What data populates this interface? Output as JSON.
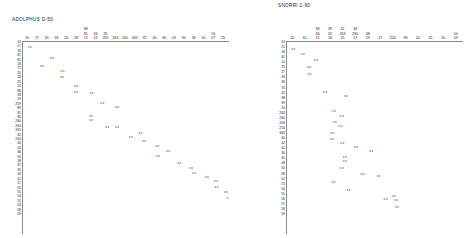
{
  "panels": [
    {
      "id": "left",
      "title": "ADOLPHUS D-50",
      "x_ticks": [
        [
          "10"
        ],
        [
          "71"
        ],
        [
          "16"
        ],
        [
          "18"
        ],
        [
          "20"
        ],
        [
          "28"
        ],
        [
          "15",
          "81",
          "88"
        ],
        [
          "24",
          "33"
        ],
        [
          "259",
          "25"
        ],
        [
          "263"
        ],
        [
          "261"
        ],
        [
          "260"
        ],
        [
          "32"
        ],
        [
          "40"
        ],
        [
          "30"
        ],
        [
          "29"
        ],
        [
          "90"
        ],
        [
          "36"
        ],
        [
          "50"
        ],
        [
          "57",
          "56"
        ],
        [
          "55"
        ]
      ],
      "y_ticks": [
        "10",
        "17",
        "16",
        "87",
        "81",
        "18",
        "71",
        "20",
        "28",
        "25",
        "24",
        "88",
        "33",
        "29",
        "259",
        "89",
        "81",
        "30",
        "260",
        "263",
        "261",
        "32",
        "264",
        "40",
        "50",
        "36",
        "90",
        "38",
        "37",
        "35",
        "34",
        "41",
        "57",
        "56",
        "55",
        "54",
        "52",
        "53",
        "58",
        "59"
      ]
    },
    {
      "id": "right",
      "title": "SNORRI 2-90",
      "x_ticks": [
        [
          "10"
        ],
        [
          "61"
        ],
        [
          "21",
          "34",
          "38"
        ],
        [
          "18",
          "32",
          "39"
        ],
        [
          "25",
          "263",
          "41"
        ],
        [
          "57",
          "260",
          "36"
        ],
        [
          "29",
          "48"
        ],
        [
          "27"
        ],
        [
          "254"
        ],
        [
          "98"
        ],
        [
          "42"
        ],
        [
          "45"
        ],
        [
          "50"
        ],
        [
          "59",
          "54"
        ]
      ],
      "y_ticks": [
        "10",
        "21",
        "18",
        "61",
        "10",
        "25",
        "27",
        "34",
        "36",
        "70",
        "32",
        "38",
        "39",
        "20",
        "263",
        "260",
        "264",
        "254",
        "363",
        "40",
        "42",
        "41",
        "30",
        "45",
        "48",
        "50",
        "98",
        "52",
        "53",
        "54",
        "55",
        "56",
        "57",
        "58",
        "59"
      ]
    }
  ],
  "chart_data": [
    {
      "type": "scatter",
      "title": "ADOLPHUS D-50",
      "xlabel": "",
      "ylabel": "",
      "marker": "xx",
      "grid": false,
      "legend": "none",
      "xlim": [
        0,
        21
      ],
      "ylim": [
        0,
        40
      ],
      "note": "Near-monotonic descending diagonal of paired 'xx' markers; row index increases downward as column index increases rightward.",
      "points": [
        {
          "x": 0.3,
          "y": 0.5
        },
        {
          "x": 2.6,
          "y": 3.0
        },
        {
          "x": 1.55,
          "y": 5.0
        },
        {
          "x": 3.65,
          "y": 6.0
        },
        {
          "x": 3.6,
          "y": 7.6
        },
        {
          "x": 5.05,
          "y": 9.6
        },
        {
          "x": 5.0,
          "y": 11.0
        },
        {
          "x": 6.6,
          "y": 11.4
        },
        {
          "x": 7.7,
          "y": 13.6
        },
        {
          "x": 9.2,
          "y": 14.6
        },
        {
          "x": 6.55,
          "y": 16.6
        },
        {
          "x": 6.55,
          "y": 17.6
        },
        {
          "x": 8.2,
          "y": 19.4
        },
        {
          "x": 9.2,
          "y": 19.2
        },
        {
          "x": 11.6,
          "y": 20.6
        },
        {
          "x": 10.6,
          "y": 21.6
        },
        {
          "x": 11.95,
          "y": 22.6
        },
        {
          "x": 13.3,
          "y": 23.8
        },
        {
          "x": 14.4,
          "y": 25.0
        },
        {
          "x": 13.35,
          "y": 26.1
        },
        {
          "x": 15.55,
          "y": 27.8
        },
        {
          "x": 16.75,
          "y": 29.0
        },
        {
          "x": 17.05,
          "y": 30.2
        },
        {
          "x": 18.35,
          "y": 31.0
        },
        {
          "x": 19.3,
          "y": 32.0
        },
        {
          "x": 19.35,
          "y": 33.4
        },
        {
          "x": 20.3,
          "y": 34.6
        },
        {
          "x": 20.6,
          "y": 36.0
        },
        {
          "x": 20.95,
          "y": 37.0
        }
      ]
    },
    {
      "type": "scatter",
      "title": "SNORRI 2-90",
      "xlabel": "",
      "ylabel": "",
      "marker": "xx",
      "grid": false,
      "legend": "none",
      "xlim": [
        0,
        14
      ],
      "ylim": [
        0,
        35
      ],
      "note": "Scattered descending band of paired 'xx' markers with several vertically stacked clusters.",
      "points": [
        {
          "x": 0.2,
          "y": 0.8
        },
        {
          "x": 0.95,
          "y": 1.8
        },
        {
          "x": 2.0,
          "y": 3.0
        },
        {
          "x": 1.45,
          "y": 4.6
        },
        {
          "x": 1.5,
          "y": 6.0
        },
        {
          "x": 2.75,
          "y": 9.6
        },
        {
          "x": 4.4,
          "y": 10.4
        },
        {
          "x": 3.45,
          "y": 13.6
        },
        {
          "x": 4.05,
          "y": 14.6
        },
        {
          "x": 3.5,
          "y": 15.9
        },
        {
          "x": 3.95,
          "y": 16.6
        },
        {
          "x": 3.3,
          "y": 18.2
        },
        {
          "x": 3.3,
          "y": 19.4
        },
        {
          "x": 4.1,
          "y": 20.2
        },
        {
          "x": 5.2,
          "y": 21.0
        },
        {
          "x": 6.4,
          "y": 21.8
        },
        {
          "x": 4.3,
          "y": 23.0
        },
        {
          "x": 4.3,
          "y": 23.8
        },
        {
          "x": 4.05,
          "y": 25.4
        },
        {
          "x": 5.7,
          "y": 26.6
        },
        {
          "x": 7.0,
          "y": 27.0
        },
        {
          "x": 3.4,
          "y": 28.2
        },
        {
          "x": 4.6,
          "y": 29.8
        },
        {
          "x": 8.2,
          "y": 31.0
        },
        {
          "x": 7.55,
          "y": 31.8
        },
        {
          "x": 8.4,
          "y": 32.0
        },
        {
          "x": 8.45,
          "y": 33.4
        }
      ]
    }
  ]
}
